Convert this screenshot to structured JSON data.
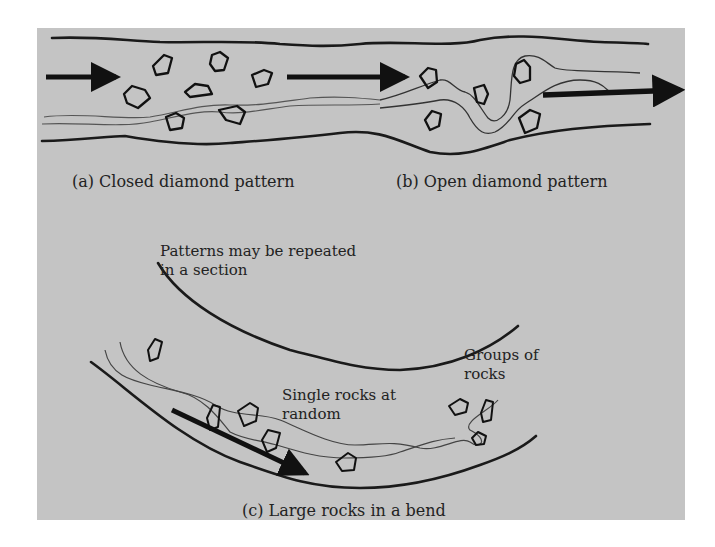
{
  "figure": {
    "panel_color": "#c4c4c4",
    "line_color": "#1a1a1a",
    "thin_line_color": "#4a4a4a"
  },
  "captions": {
    "a": "(a) Closed diamond pattern",
    "b": "(b) Open diamond pattern",
    "c": "(c) Large rocks in a bend"
  },
  "annotations": {
    "repeated_line1": "Patterns may be repeated",
    "repeated_line2": "in a section",
    "single_line1": "Single rocks at",
    "single_line2": "random",
    "groups_line1": "Groups of",
    "groups_line2": "rocks"
  }
}
